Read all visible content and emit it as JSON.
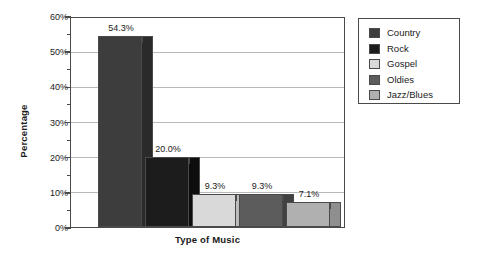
{
  "chart_data": {
    "type": "bar",
    "title": "",
    "xlabel": "Type of Music",
    "ylabel": "Percentage",
    "categories": [
      "Country",
      "Rock",
      "Gospel",
      "Oldies",
      "Jazz/Blues"
    ],
    "values": [
      54.3,
      20.0,
      9.3,
      9.3,
      7.1
    ],
    "data_labels": [
      "54.3%",
      "20.0%",
      "9.3%",
      "9.3%",
      "7.1%"
    ],
    "ylim": [
      0,
      60
    ],
    "y_major_step": 10,
    "y_minor_step": 5,
    "y_tick_labels": [
      "0%",
      "10%",
      "20%",
      "30%",
      "40%",
      "50%",
      "60%"
    ],
    "y_tick_values": [
      0,
      10,
      20,
      30,
      40,
      50,
      60
    ],
    "grid": "horizontal",
    "legend_position": "right-outside",
    "series_colors": {
      "Country": "#3d3d3d",
      "Rock": "#1c1c1c",
      "Gospel": "#d9d9d9",
      "Oldies": "#5c5c5c",
      "Jazz/Blues": "#b0b0b0"
    },
    "series_side_colors": {
      "Country": "#2a2a2a",
      "Rock": "#0d0d0d",
      "Gospel": "#bcbcbc",
      "Oldies": "#414141",
      "Jazz/Blues": "#8f8f8f"
    },
    "axis_color": "#4a4a4a",
    "grid_color": "#b9b9b9",
    "text_color": "#1a1a1a",
    "background": "#ffffff"
  },
  "legend": {
    "items": [
      {
        "label": "Country"
      },
      {
        "label": "Rock"
      },
      {
        "label": "Gospel"
      },
      {
        "label": "Oldies"
      },
      {
        "label": "Jazz/Blues"
      }
    ]
  }
}
